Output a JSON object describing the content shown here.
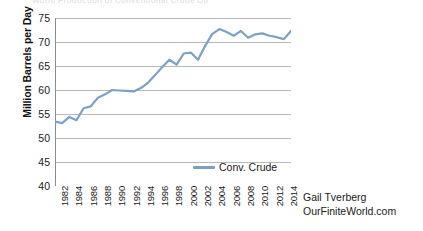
{
  "clipped_header": {
    "text": "World Production of Conventional Crude Oil"
  },
  "attribution": {
    "author": "Gail Tverberg",
    "site": "OurFiniteWorld.com"
  },
  "legend": {
    "position": "inside-bottom-center",
    "entries": [
      {
        "label": "Conv. Crude",
        "color": "#7aa0c4"
      }
    ]
  },
  "colors": {
    "line": "#7ba1c7",
    "gridline": "#9a9a9a",
    "axis": "#8c8c8c",
    "text": "#1a1a1a",
    "background": "#ffffff"
  },
  "chart_data": {
    "type": "line",
    "title": "",
    "xlabel": "",
    "ylabel": "Million Barrels per Day",
    "ylim": [
      40,
      75
    ],
    "y_ticks": [
      40,
      45,
      50,
      55,
      60,
      65,
      70,
      75
    ],
    "xlim": [
      1982,
      2015
    ],
    "x_tick_labels": [
      1982,
      1984,
      1986,
      1988,
      1990,
      1992,
      1994,
      1996,
      1998,
      2000,
      2002,
      2004,
      2006,
      2008,
      2010,
      2012,
      2014
    ],
    "x_minor_tick_interval": 1,
    "grid": "horizontal",
    "legend_position": "inside bottom center",
    "series": [
      {
        "name": "Conv. Crude",
        "color": "#7ba1c7",
        "x": [
          1982,
          1983,
          1984,
          1985,
          1986,
          1987,
          1988,
          1989,
          1990,
          1991,
          1992,
          1993,
          1994,
          1995,
          1996,
          1997,
          1998,
          1999,
          2000,
          2001,
          2002,
          2003,
          2004,
          2005,
          2006,
          2007,
          2008,
          2009,
          2010,
          2011,
          2012,
          2013,
          2014,
          2015
        ],
        "values": [
          53.4,
          53.1,
          54.4,
          53.7,
          56.2,
          56.6,
          58.4,
          59.1,
          60.0,
          59.9,
          59.8,
          59.7,
          60.4,
          61.5,
          63.1,
          64.8,
          66.3,
          65.3,
          67.6,
          67.8,
          66.3,
          69.2,
          71.7,
          72.7,
          72.1,
          71.3,
          72.3,
          70.9,
          71.6,
          71.8,
          71.3,
          71.0,
          70.6,
          72.3
        ]
      }
    ]
  }
}
